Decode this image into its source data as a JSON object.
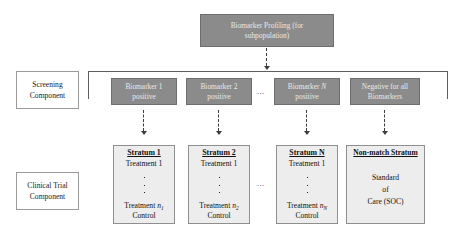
{
  "diagram": {
    "title_box": {
      "line1": "Biomarker Profiling (for",
      "line2": "subpopulation)"
    },
    "row_labels": [
      {
        "line1": "Screening",
        "line2": "Component"
      },
      {
        "line1": "Clinical Trial",
        "line2": "Component"
      }
    ],
    "screening_boxes": [
      {
        "line1": "Biomarker 1",
        "line2": "positive"
      },
      {
        "line1": "Biomarker 2",
        "line2": "positive"
      },
      {
        "line1_pre": "Biomarker ",
        "line1_ital": "N",
        "line2": "positive"
      },
      {
        "line1": "Negative for all",
        "line2": "Biomarkers"
      }
    ],
    "strata": [
      {
        "title": "Stratum 1",
        "first_treatment": "Treatment 1",
        "last_treatment_pre": "Treatment ",
        "last_treatment_sub": "1",
        "last_treatment_var": "n",
        "control": "Control"
      },
      {
        "title": "Stratum 2",
        "first_treatment": "Treatment 1",
        "last_treatment_pre": "Treatment ",
        "last_treatment_sub": "2",
        "last_treatment_var": "n",
        "control": "Control"
      },
      {
        "title": "Stratum N",
        "first_treatment": "Treatment 1",
        "last_treatment_pre": "Treatment ",
        "last_treatment_sub": "N",
        "last_treatment_var": "n",
        "control": "Control"
      }
    ],
    "nonmatch": {
      "title": "Non-match Stratum",
      "line1": "Standard",
      "line2": "of",
      "line3": "Care (SOC)"
    },
    "ellipses": {
      "screening": "...",
      "trial": "..."
    },
    "colors": {
      "gray_box_fill": "#8b8b8b",
      "gray_box_text": "#e9e9e9",
      "stratum_fill": "#ededed",
      "line": "#5e5e5e",
      "page_background": "#ffffff"
    }
  }
}
